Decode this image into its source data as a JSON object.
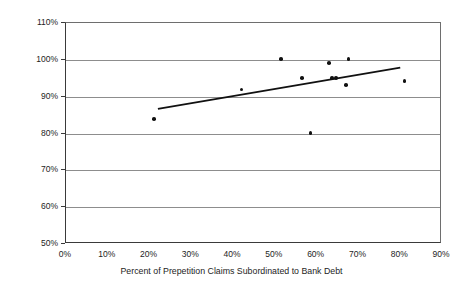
{
  "chart_data": {
    "type": "scatter",
    "title": "",
    "xlabel": "Percent of Prepetition Claims Subordinated to Bank Debt",
    "ylabel": "Present Value of Recoveries",
    "xlim": [
      0,
      90
    ],
    "ylim": [
      50,
      110
    ],
    "grid": true,
    "legend": "none",
    "x_tick_labels": [
      "0%",
      "10%",
      "20%",
      "30%",
      "40%",
      "50%",
      "60%",
      "70%",
      "80%",
      "90%"
    ],
    "x_tick_values": [
      0,
      10,
      20,
      30,
      40,
      50,
      60,
      70,
      80,
      90
    ],
    "y_tick_labels": [
      "50%",
      "60%",
      "70%",
      "80%",
      "90%",
      "100%",
      "110%"
    ],
    "y_tick_values": [
      50,
      60,
      70,
      80,
      90,
      100,
      110
    ],
    "series": [
      {
        "name": "Recoveries",
        "marker": "filled-diamond",
        "color": "#111111",
        "points": [
          {
            "x": 21.0,
            "y": 84.0
          },
          {
            "x": 42.0,
            "y": 92.0
          },
          {
            "x": 51.5,
            "y": 100.2
          },
          {
            "x": 56.5,
            "y": 95.1
          },
          {
            "x": 58.5,
            "y": 80.1
          },
          {
            "x": 63.0,
            "y": 99.2
          },
          {
            "x": 63.6,
            "y": 95.1
          },
          {
            "x": 64.6,
            "y": 95.0
          },
          {
            "x": 67.0,
            "y": 93.2
          },
          {
            "x": 67.6,
            "y": 100.2
          },
          {
            "x": 81.0,
            "y": 94.3
          }
        ]
      }
    ],
    "trendline": {
      "name": "Linear trend",
      "color": "#111111",
      "x0": 22.0,
      "y0": 86.7,
      "x1": 80.0,
      "y1": 97.9
    }
  },
  "axes": {
    "y_title": "Present Value of Recoveries",
    "x_title": "Percent of Prepetition Claims Subordinated to Bank Debt"
  }
}
